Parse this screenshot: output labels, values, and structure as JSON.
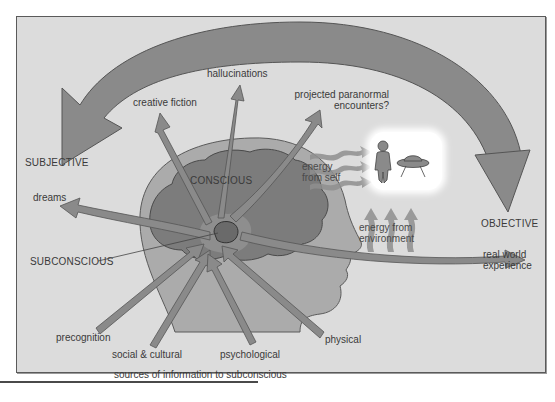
{
  "diagram": {
    "type": "concept-flow",
    "colors": {
      "background": "#dcdcdc",
      "frame": "#5a5a5a",
      "arrow": "#8c8c8c",
      "arrow_highlight": "#f2f2f2",
      "head": "#ababab",
      "brain": "#7c7c7c",
      "text": "#3a3a3a",
      "cloud": "#ffffff"
    },
    "poles": {
      "subjective": "SUBJECTIVE",
      "objective": "OBJECTIVE"
    },
    "regions": {
      "conscious": "CONSCIOUS",
      "subconscious": "SUBCONSCIOUS"
    },
    "outputs": [
      {
        "id": "dreams",
        "label": "dreams"
      },
      {
        "id": "creative-fiction",
        "label": "creative fiction"
      },
      {
        "id": "hallucinations",
        "label": "hallucinations"
      },
      {
        "id": "projected-paranormal",
        "label_line1": "projected paranormal",
        "label_line2": "encounters?"
      },
      {
        "id": "real-world",
        "label_line1": "real world",
        "label_line2": "experience"
      }
    ],
    "inputs": [
      {
        "id": "precognition",
        "label": "precognition"
      },
      {
        "id": "social-cultural",
        "label": "social & cultural"
      },
      {
        "id": "psychological",
        "label": "psychological"
      },
      {
        "id": "physical",
        "label": "physical"
      }
    ],
    "energy": {
      "self_line1": "energy",
      "self_line2": "from self",
      "env_line1": "energy from",
      "env_line2": "environment"
    },
    "icons": [
      "alien-figure-icon",
      "flying-saucer-icon"
    ],
    "caption": "sources of information to subconscious"
  }
}
